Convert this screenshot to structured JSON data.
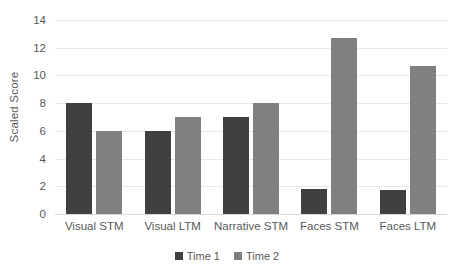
{
  "chart_data": {
    "type": "bar",
    "title": "",
    "xlabel": "",
    "ylabel": "Scaled Score",
    "ylim": [
      0,
      14
    ],
    "ytick_step": 2,
    "yticks": [
      0,
      2,
      4,
      6,
      8,
      10,
      12,
      14
    ],
    "grid": true,
    "legend_position": "bottom",
    "categories": [
      "Visual STM",
      "Visual LTM",
      "Narrative STM",
      "Faces STM",
      "Faces LTM"
    ],
    "series": [
      {
        "name": "Time 1",
        "color": "#404040",
        "values": [
          8,
          6,
          7,
          1.8,
          1.7
        ]
      },
      {
        "name": "Time 2",
        "color": "#808080",
        "values": [
          6,
          7,
          8,
          12.7,
          10.7
        ]
      }
    ]
  },
  "legend": {
    "items": [
      {
        "label": "Time 1"
      },
      {
        "label": "Time 2"
      }
    ]
  }
}
